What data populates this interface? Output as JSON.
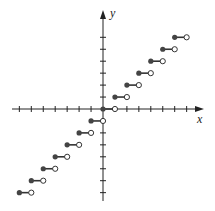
{
  "chart_data": {
    "type": "scatter",
    "title": "",
    "function": "y = floor(x)",
    "xlabel": "x",
    "ylabel": "y",
    "xlim": [
      -7.3,
      8.5
    ],
    "ylim": [
      -7.7,
      8.3
    ],
    "grid": false,
    "x_ticks": [
      -7,
      -6,
      -5,
      -4,
      -3,
      -2,
      -1,
      1,
      2,
      3,
      4,
      5,
      6,
      7
    ],
    "y_ticks": [
      -7,
      -6,
      -5,
      -4,
      -3,
      -2,
      -1,
      1,
      2,
      3,
      4,
      5,
      6
    ],
    "steps": [
      {
        "x_start": -7,
        "x_end": -6,
        "y": -7
      },
      {
        "x_start": -6,
        "x_end": -5,
        "y": -6
      },
      {
        "x_start": -5,
        "x_end": -4,
        "y": -5
      },
      {
        "x_start": -4,
        "x_end": -3,
        "y": -4
      },
      {
        "x_start": -3,
        "x_end": -2,
        "y": -3
      },
      {
        "x_start": -2,
        "x_end": -1,
        "y": -2
      },
      {
        "x_start": -1,
        "x_end": 0,
        "y": -1
      },
      {
        "x_start": 0,
        "x_end": 1,
        "y": 0
      },
      {
        "x_start": 1,
        "x_end": 2,
        "y": 1
      },
      {
        "x_start": 2,
        "x_end": 3,
        "y": 2
      },
      {
        "x_start": 3,
        "x_end": 4,
        "y": 3
      },
      {
        "x_start": 4,
        "x_end": 5,
        "y": 4
      },
      {
        "x_start": 5,
        "x_end": 6,
        "y": 5
      },
      {
        "x_start": 6,
        "x_end": 7,
        "y": 6
      }
    ],
    "closed_endpoint": "left",
    "open_endpoint": "right"
  },
  "axes": {
    "x_label": "x",
    "y_label": "y"
  },
  "colors": {
    "axis": "#222222",
    "dot_fill": "#444444",
    "open_fill": "#ffffff"
  }
}
